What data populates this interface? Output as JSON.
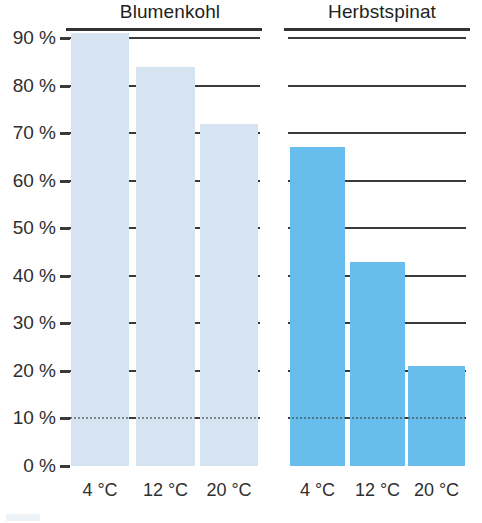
{
  "chart_data": {
    "type": "bar",
    "title": "",
    "xlabel": "",
    "ylabel": "",
    "ylim": [
      0,
      90
    ],
    "grid": true,
    "legend_position": "none",
    "ytick_labels": [
      "90 %",
      "80 %",
      "70 %",
      "60 %",
      "50 %",
      "40 %",
      "30 %",
      "20 %",
      "10 %",
      "0 %"
    ],
    "ytick_values": [
      90,
      80,
      70,
      60,
      50,
      40,
      30,
      20,
      10,
      0
    ],
    "categories": [
      "4 °C",
      "12 °C",
      "20 °C"
    ],
    "groups": [
      {
        "name": "Blumenkohl",
        "color": "#d6e4f2",
        "values": [
          91,
          84,
          72
        ]
      },
      {
        "name": "Herbstspinat",
        "color": "#67bdeb",
        "values": [
          67,
          43,
          21
        ]
      }
    ]
  },
  "colors": {
    "blumenkohl": "#d6e4f2",
    "herbstspinat": "#67bdeb",
    "axis": "#333333",
    "grid": "#3a3a3a",
    "text": "#2f2f2f",
    "background": "#ffffff"
  }
}
